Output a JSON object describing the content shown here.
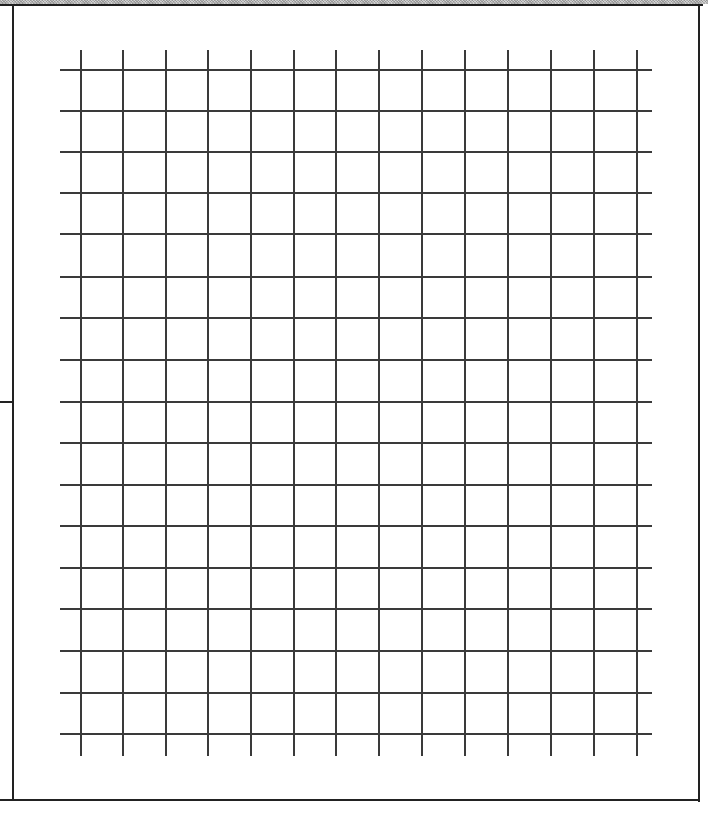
{
  "page": {
    "type": "blank grid sheet",
    "frame": {
      "left": 13,
      "top": 5,
      "right": 699,
      "bottom": 800
    },
    "side_tick_y": 402
  },
  "grid": {
    "columns_x": [
      81,
      123,
      166,
      208,
      251,
      294,
      336,
      379,
      422,
      465,
      508,
      551,
      594,
      637
    ],
    "rows_y": [
      70,
      111,
      152,
      193,
      234,
      277,
      318,
      360,
      402,
      443,
      485,
      526,
      568,
      609,
      651,
      693,
      734
    ],
    "h_line_extent": [
      60,
      652
    ],
    "v_line_extent": [
      50,
      756
    ],
    "line_color": "#3a3a3a",
    "vertical_count": 14,
    "horizontal_count": 17
  },
  "colors": {
    "background": "#ffffff",
    "border": "#222222",
    "top_band": "#b8b8b8"
  }
}
